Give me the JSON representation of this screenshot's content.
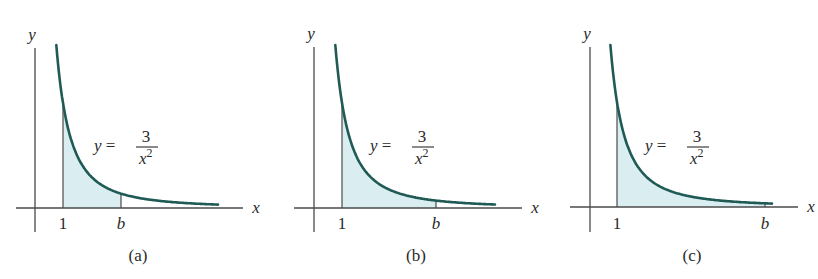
{
  "figure": {
    "equation": {
      "lhs": "y =",
      "numerator": "3",
      "denominator_base": "x",
      "denominator_exp": "2"
    },
    "axis_labels": {
      "x": "x",
      "y": "y"
    },
    "colors": {
      "curve": "#1f5a55",
      "fill": "#daeef1",
      "axis": "#4a4a4a",
      "text": "#2a2a2a"
    },
    "panels": [
      {
        "id": "a",
        "caption": "(a)",
        "tick_left": "1",
        "tick_right": "b"
      },
      {
        "id": "b",
        "caption": "(b)",
        "tick_left": "1",
        "tick_right": "b"
      },
      {
        "id": "c",
        "caption": "(c)",
        "tick_left": "1",
        "tick_right": "b"
      }
    ]
  },
  "chart_data": [
    {
      "type": "area",
      "title": "(a)",
      "function": "y = 3/x^2",
      "shaded_interval": [
        1,
        "b"
      ],
      "b_relative": "small",
      "xlabel": "x",
      "ylabel": "y",
      "ticks": [
        "1",
        "b"
      ]
    },
    {
      "type": "area",
      "title": "(b)",
      "function": "y = 3/x^2",
      "shaded_interval": [
        1,
        "b"
      ],
      "b_relative": "medium",
      "xlabel": "x",
      "ylabel": "y",
      "ticks": [
        "1",
        "b"
      ]
    },
    {
      "type": "area",
      "title": "(c)",
      "function": "y = 3/x^2",
      "shaded_interval": [
        1,
        "b"
      ],
      "b_relative": "large",
      "xlabel": "x",
      "ylabel": "y",
      "ticks": [
        "1",
        "b"
      ]
    }
  ]
}
